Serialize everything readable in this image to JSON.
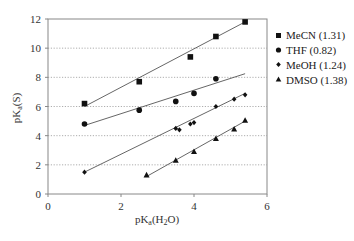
{
  "chart_data": {
    "type": "scatter",
    "title": "",
    "xlabel": "pKa(H2O)",
    "ylabel": "pKa(S)",
    "xlim": [
      0,
      6
    ],
    "ylim": [
      0,
      12
    ],
    "xticks": [
      0,
      2,
      4,
      6
    ],
    "yticks": [
      0,
      2,
      4,
      6,
      8,
      10,
      12
    ],
    "grid": "horizontal dotted",
    "legend_position": "right",
    "series": [
      {
        "name": "MeCN (1.31)",
        "marker": "square",
        "points": [
          [
            1.0,
            6.2
          ],
          [
            2.5,
            7.7
          ],
          [
            3.9,
            9.4
          ],
          [
            4.6,
            10.8
          ],
          [
            5.4,
            11.8
          ]
        ],
        "fit": [
          [
            1.0,
            6.0
          ],
          [
            5.4,
            11.8
          ]
        ]
      },
      {
        "name": "THF (0.82)",
        "marker": "circle",
        "points": [
          [
            1.0,
            4.8
          ],
          [
            2.5,
            5.75
          ],
          [
            3.5,
            6.35
          ],
          [
            4.0,
            6.9
          ],
          [
            4.6,
            7.9
          ]
        ],
        "fit": [
          [
            1.0,
            4.7
          ],
          [
            5.4,
            8.25
          ]
        ]
      },
      {
        "name": "MeOH (1.24)",
        "marker": "diamond",
        "points": [
          [
            1.0,
            1.5
          ],
          [
            3.5,
            4.5
          ],
          [
            3.6,
            4.4
          ],
          [
            3.9,
            4.8
          ],
          [
            4.0,
            4.9
          ],
          [
            4.6,
            6.0
          ],
          [
            5.1,
            6.5
          ],
          [
            5.4,
            6.8
          ]
        ],
        "fit": [
          [
            1.0,
            1.5
          ],
          [
            5.4,
            6.9
          ]
        ]
      },
      {
        "name": "DMSO (1.38)",
        "marker": "triangle",
        "points": [
          [
            2.7,
            1.3
          ],
          [
            3.5,
            2.3
          ],
          [
            4.0,
            2.9
          ],
          [
            4.6,
            3.8
          ],
          [
            5.1,
            4.45
          ],
          [
            5.4,
            5.05
          ]
        ],
        "fit": [
          [
            2.7,
            1.2
          ],
          [
            5.4,
            5.0
          ]
        ]
      }
    ]
  },
  "labels": {
    "xlabel_main": "pK",
    "xlabel_sub": "a",
    "xlabel_rest": "(H",
    "xlabel_sub2": "2",
    "xlabel_end": "O)",
    "ylabel_main": "pK",
    "ylabel_sub": "a",
    "ylabel_rest": "(S)",
    "legend": [
      "MeCN (1.31)",
      "THF (0.82)",
      "MeOH (1.24)",
      "DMSO (1.38)"
    ],
    "yticks": [
      "0",
      "2",
      "4",
      "6",
      "8",
      "10",
      "12"
    ],
    "xticks": [
      "0",
      "2",
      "4",
      "6"
    ]
  }
}
